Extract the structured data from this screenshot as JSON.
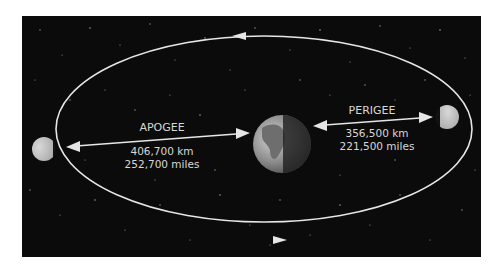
{
  "diagram": {
    "background_color": "#0b0b0b",
    "orbit_color": "#e6e6e6",
    "labels": {
      "apogee": {
        "name": "APOGEE",
        "km": "406,700 km",
        "miles": "252,700 miles"
      },
      "perigee": {
        "name": "PERIGEE",
        "km": "356,500 km",
        "miles": "221,500 miles"
      }
    },
    "bodies": [
      {
        "name": "Earth",
        "position": "center"
      },
      {
        "name": "Moon",
        "position": "apogee (left)"
      },
      {
        "name": "Moon",
        "position": "perigee (right)"
      }
    ],
    "orbit_direction": "counterclockwise"
  }
}
